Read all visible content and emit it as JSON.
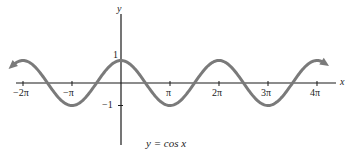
{
  "chart_data": {
    "type": "line",
    "title": "",
    "function": "y = cos x",
    "caption": "y = cos x",
    "xlabel": "x",
    "ylabel": "y",
    "x_tick_labels": [
      "−2π",
      "−π",
      "π",
      "2π",
      "3π",
      "4π"
    ],
    "x_tick_values": [
      -6.283,
      -3.142,
      3.142,
      6.283,
      9.425,
      12.566
    ],
    "y_tick_labels": [
      "1",
      "−1"
    ],
    "y_tick_values": [
      1,
      -1
    ],
    "xlim": [
      -7.0,
      13.2
    ],
    "ylim": [
      -1.6,
      2.5
    ],
    "grid": false,
    "legend": "none",
    "series": [
      {
        "name": "cos x",
        "color": "#7a7a7a",
        "x": [
          -7.0,
          -6.283,
          -4.712,
          -3.142,
          -1.571,
          0,
          1.571,
          3.142,
          4.712,
          6.283,
          7.854,
          9.425,
          10.996,
          12.566,
          13.2
        ],
        "y": [
          0.754,
          1,
          0,
          -1,
          0,
          1,
          0,
          -1,
          0,
          1,
          0,
          -1,
          0,
          1,
          0.8
        ],
        "arrows_at_ends": true
      }
    ]
  },
  "colors": {
    "curve": "#7a7a7a",
    "axes": "#1a1a1a"
  }
}
